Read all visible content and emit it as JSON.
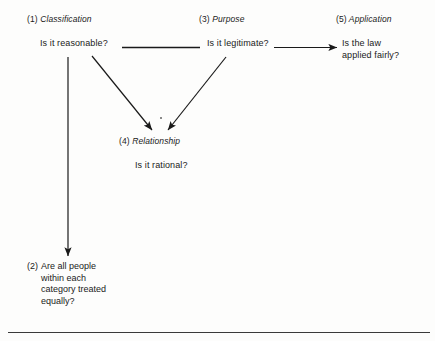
{
  "diagram": {
    "title_visible": false,
    "background_color": "#fdfdfc",
    "line_color": "#1a1a1a",
    "nodes": [
      {
        "id": "1",
        "number": "(1)",
        "label": "Classification",
        "question": "Is it reasonable?"
      },
      {
        "id": "2",
        "number": "(2)",
        "label": "",
        "question_line1": "Are all people",
        "question_line2": "within each",
        "question_line3": "category treated",
        "question_line4": "equally?"
      },
      {
        "id": "3",
        "number": "(3)",
        "label": "Purpose",
        "question": "Is it legitimate?"
      },
      {
        "id": "4",
        "number": "(4)",
        "label": "Relationship",
        "question": "Is it rational?"
      },
      {
        "id": "5",
        "number": "(5)",
        "label": "Application",
        "question_line1": "Is the law",
        "question_line2": "applied fairly?"
      }
    ],
    "edges": [
      {
        "name": "classification-to-purpose",
        "from": "1",
        "to": "3",
        "style": "plain-line",
        "arrowhead": false
      },
      {
        "name": "classification-to-equal-treatment",
        "from": "1",
        "to": "2",
        "style": "vertical-line",
        "arrowhead": true
      },
      {
        "name": "classification-to-relationship",
        "from": "1",
        "to": "4",
        "style": "diagonal-line",
        "arrowhead": true
      },
      {
        "name": "purpose-to-relationship",
        "from": "3",
        "to": "4",
        "style": "diagonal-line",
        "arrowhead": true
      },
      {
        "name": "purpose-to-application",
        "from": "3",
        "to": "5",
        "style": "horizontal-line",
        "arrowhead": true
      }
    ],
    "footer_rule": true
  }
}
